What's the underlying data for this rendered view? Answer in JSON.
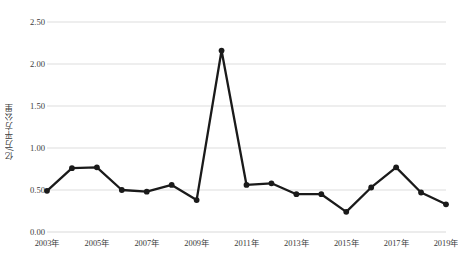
{
  "chart_data": {
    "type": "line",
    "title": "",
    "xlabel": "",
    "ylabel": "亿/万平方公里",
    "ylim": [
      0.0,
      2.5
    ],
    "ytick_labels": [
      "0.00",
      "0.50",
      "1.00",
      "1.50",
      "2.00",
      "2.50"
    ],
    "ytick_values": [
      0.0,
      0.5,
      1.0,
      1.5,
      2.0,
      2.5
    ],
    "grid": "horizontal",
    "legend": "none",
    "marker": "circle",
    "line_color": "#1a1a1a",
    "grid_color": "#d9d9d9",
    "x": [
      2003,
      2004,
      2005,
      2006,
      2007,
      2008,
      2009,
      2010,
      2011,
      2012,
      2013,
      2014,
      2015,
      2016,
      2017,
      2018,
      2019
    ],
    "categories": [
      "2003年",
      "2004年",
      "2005年",
      "2006年",
      "2007年",
      "2008年",
      "2009年",
      "2010年",
      "2011年",
      "2012年",
      "2013年",
      "2014年",
      "2015年",
      "2016年",
      "2017年",
      "2018年",
      "2019年"
    ],
    "xtick_labels": [
      "2003年",
      "2005年",
      "2007年",
      "2009年",
      "2011年",
      "2013年",
      "2015年",
      "2017年",
      "2019年"
    ],
    "xtick_values": [
      2003,
      2005,
      2007,
      2009,
      2011,
      2013,
      2015,
      2017,
      2019
    ],
    "values": [
      0.49,
      0.76,
      0.77,
      0.5,
      0.48,
      0.56,
      0.38,
      2.16,
      0.56,
      0.58,
      0.45,
      0.45,
      0.24,
      0.53,
      0.77,
      0.47,
      0.33
    ]
  }
}
